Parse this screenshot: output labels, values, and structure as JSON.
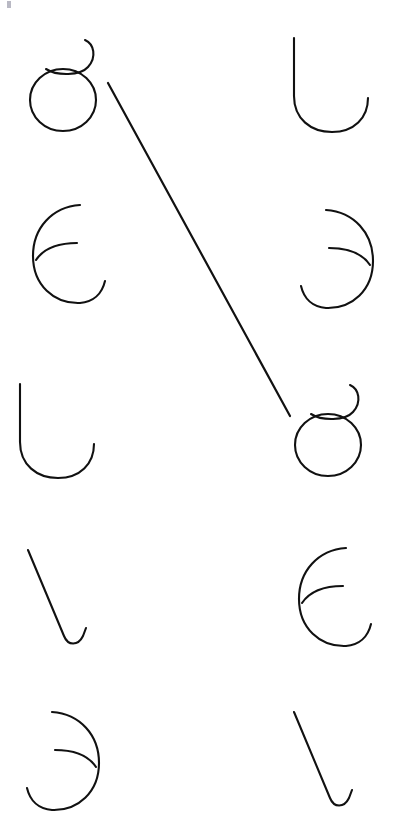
{
  "canvas": {
    "width": 394,
    "height": 838,
    "background": "#ffffff",
    "stroke_color": "#111111",
    "stroke_width": 2.1
  },
  "puzzle": {
    "type": "shape-matching",
    "description": "Two columns of five abstract hand-drawn glyphs; a single straight line connects one left glyph to its identical counterpart on the right.",
    "columns": 2,
    "rows": 5
  },
  "glyph_library": {
    "circle-curl": {
      "name": "circle-with-curl",
      "label": "circle with upward curl"
    },
    "epsilon": {
      "name": "epsilon-double-arc",
      "label": "C arc with inner arc"
    },
    "u-hook": {
      "name": "u-hook",
      "label": "tall U hook"
    },
    "diagonal-hook": {
      "name": "diagonal-hook",
      "label": "diagonal stroke with bottom hook"
    },
    "epsilon-mirrored": {
      "name": "epsilon-double-arc-mirrored",
      "label": "reversed C arc with inner arc"
    }
  },
  "left_column": [
    {
      "index": 1,
      "shape": "circle-curl",
      "name": "left-glyph-1",
      "x": 28,
      "y": 38,
      "connected": true
    },
    {
      "index": 2,
      "shape": "epsilon",
      "name": "left-glyph-2",
      "x": 30,
      "y": 203,
      "connected": false
    },
    {
      "index": 3,
      "shape": "u-hook",
      "name": "left-glyph-3",
      "x": 14,
      "y": 382,
      "connected": false
    },
    {
      "index": 4,
      "shape": "diagonal-hook",
      "name": "left-glyph-4",
      "x": 26,
      "y": 548,
      "connected": false
    },
    {
      "index": 5,
      "shape": "epsilon-mirrored",
      "name": "left-glyph-5",
      "x": 22,
      "y": 710,
      "connected": false
    }
  ],
  "right_column": [
    {
      "index": 1,
      "shape": "u-hook",
      "name": "right-glyph-1",
      "x": 288,
      "y": 36,
      "connected": false
    },
    {
      "index": 2,
      "shape": "epsilon-mirrored",
      "name": "right-glyph-2",
      "x": 296,
      "y": 208,
      "connected": false
    },
    {
      "index": 3,
      "shape": "circle-curl",
      "name": "right-glyph-3",
      "x": 293,
      "y": 383,
      "connected": true
    },
    {
      "index": 4,
      "shape": "epsilon",
      "name": "right-glyph-4",
      "x": 296,
      "y": 546,
      "connected": false
    },
    {
      "index": 5,
      "shape": "diagonal-hook",
      "name": "right-glyph-5",
      "x": 292,
      "y": 710,
      "connected": false
    }
  ],
  "connections": [
    {
      "name": "match-line-1",
      "from": "left-glyph-1",
      "to": "right-glyph-3",
      "x1": 108,
      "y1": 83,
      "x2": 290,
      "y2": 416
    }
  ],
  "corner_mark": {
    "name": "corner-tick",
    "color": "#b9b9c4",
    "visible": true
  }
}
